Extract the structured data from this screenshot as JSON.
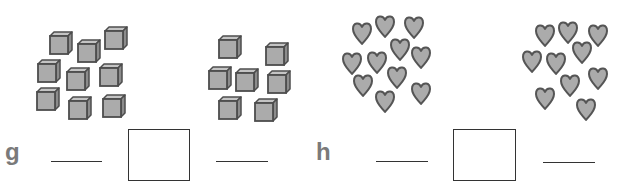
{
  "problems": [
    {
      "label": "g",
      "left_group": {
        "item": "cube",
        "count": 9
      },
      "right_group": {
        "item": "cube",
        "count": 7
      }
    },
    {
      "label": "h",
      "left_group": {
        "item": "heart",
        "count": 11
      },
      "right_group": {
        "item": "heart",
        "count": 10
      }
    }
  ],
  "colors": {
    "fill": "#ababab",
    "side": "#8c8c8c",
    "top": "#c4c4c4",
    "outline": "#4d4d4d",
    "label": "#7a7a7a"
  }
}
